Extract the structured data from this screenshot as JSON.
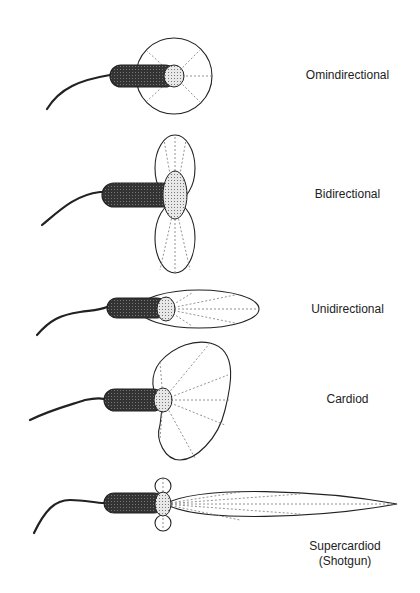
{
  "diagram": {
    "patterns": [
      {
        "id": "omni",
        "label": "Omindirectional",
        "label_line2": ""
      },
      {
        "id": "bi",
        "label": "Bidirectional",
        "label_line2": ""
      },
      {
        "id": "uni",
        "label": "Unidirectional",
        "label_line2": ""
      },
      {
        "id": "cardioid",
        "label": "Cardiod",
        "label_line2": ""
      },
      {
        "id": "supercardioid",
        "label": "Supercardiod",
        "label_line2": "(Shotgun)"
      }
    ],
    "colors": {
      "outline": "#222222",
      "rays": "#777777",
      "background": "#ffffff"
    }
  }
}
